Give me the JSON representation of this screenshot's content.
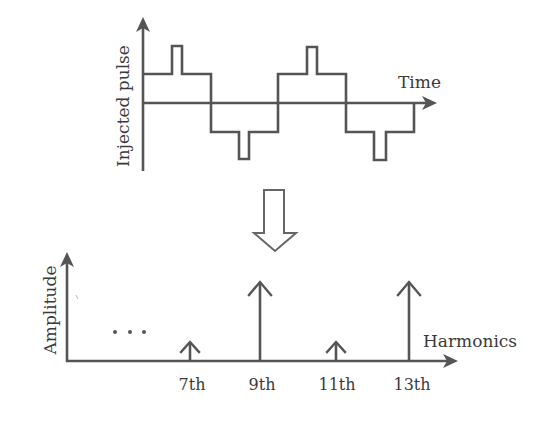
{
  "top_panel": {
    "y_axis_label": "Injected pulse",
    "x_axis_label": "Time",
    "description": "Stepped square wave with narrow injected pulse at center of each half-cycle"
  },
  "transition_icon": "hollow-down-arrow",
  "bottom_panel": {
    "y_axis_label": "Amplitude",
    "x_axis_label": "Harmonics",
    "ellipsis": "...",
    "harmonics": [
      {
        "label": "7th",
        "amplitude": "small"
      },
      {
        "label": "9th",
        "amplitude": "large"
      },
      {
        "label": "11th",
        "amplitude": "small"
      },
      {
        "label": "13th",
        "amplitude": "large"
      }
    ]
  },
  "colors": {
    "line": "#555555",
    "text": "#3a3a3a",
    "background": "#ffffff"
  }
}
